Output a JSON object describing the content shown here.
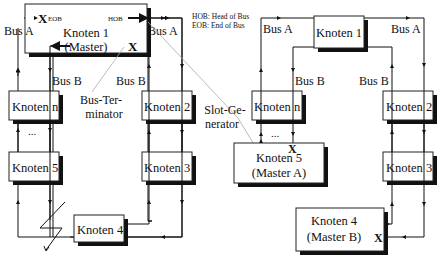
{
  "legend": {
    "hob": "HOB: Head of Bus",
    "eob": "EOB:  End of Bus"
  },
  "left_ring": {
    "bus_a_left": "Bus A",
    "bus_a_right": "Bus A",
    "bus_b_left": "Bus B",
    "bus_b_right": "Bus B",
    "master": {
      "line1": "Knoten 1",
      "line2": "(Master)",
      "eob": "EOB",
      "hob": "HOB",
      "x_mark": "X"
    },
    "nodes": [
      "Knoten n",
      "Knoten 2",
      "Knoten 5",
      "Knoten 3",
      "Knoten 4"
    ],
    "ellipsis": "...",
    "bus_terminator": [
      "Bus-Ter-",
      "minator"
    ],
    "slot_generator": [
      "Slot-Ge-",
      "nerator"
    ]
  },
  "right_ring": {
    "bus_a_left": "Bus A",
    "bus_a_right": "Bus A",
    "bus_b_left": "Bus B",
    "bus_b_right": "Bus B",
    "nodes": [
      "Knoten 1",
      "Knoten n",
      "Knoten 2",
      "Knoten 3"
    ],
    "ellipsis": "...",
    "master_a": {
      "line1": "Knoten 5",
      "line2": "(Master A)",
      "x_mark": "X"
    },
    "master_b": {
      "line1": "Knoten 4",
      "line2": "(Master B)",
      "x_mark": "X"
    }
  }
}
